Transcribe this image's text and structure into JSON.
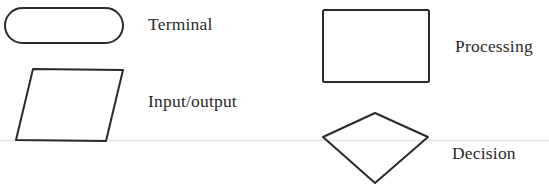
{
  "diagram": {
    "type": "flowchart-symbol-legend",
    "stroke_color": "#2a2a2a",
    "text_color": "#2a2a2a",
    "symbols": [
      {
        "shape": "rounded-rectangle",
        "label": "Terminal"
      },
      {
        "shape": "parallelogram",
        "label": "Input/output"
      },
      {
        "shape": "rectangle",
        "label": "Processing"
      },
      {
        "shape": "diamond",
        "label": "Decision"
      }
    ]
  }
}
